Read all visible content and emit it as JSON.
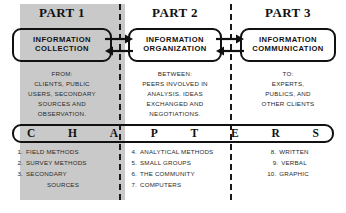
{
  "diagram": {
    "banner_word": "CHAPTERS",
    "banner_letters": [
      "C",
      "H",
      "A",
      "P",
      "T",
      "E",
      "R",
      "S"
    ],
    "colors": {
      "ink": "#111111",
      "shade": "#c9c9c9",
      "body_text": "#2a2a2a",
      "page": "#ffffff"
    },
    "connectors": [
      {
        "name": "collection-organization-arrows",
        "direction": "bidirectional"
      },
      {
        "name": "organization-communication-arrows",
        "direction": "bidirectional"
      }
    ],
    "parts": [
      {
        "heading": "PART 1",
        "box": {
          "line1": "INFORMATION",
          "line2": "COLLECTION"
        },
        "description": [
          "FROM:",
          "CLIENTS, PUBLIC",
          "USERS, SECONDARY",
          "SOURCES AND",
          "OBSERVATION."
        ],
        "chapters": [
          {
            "num": "1.",
            "title": "FIELD METHODS"
          },
          {
            "num": "2.",
            "title": "SURVEY METHODS"
          },
          {
            "num": "3.",
            "title": "SECONDARY"
          },
          {
            "num": "",
            "title": "SOURCES"
          }
        ]
      },
      {
        "heading": "PART 2",
        "box": {
          "line1": "INFORMATION",
          "line2": "ORGANIZATION"
        },
        "description": [
          "BETWEEN:",
          "PEERS INVOLVED IN",
          "ANALYSIS. IDEAS",
          "EXCHANGED AND",
          "NEGOTIATIONS."
        ],
        "chapters": [
          {
            "num": "4.",
            "title": "ANALYTICAL METHODS"
          },
          {
            "num": "5.",
            "title": "SMALL GROUPS"
          },
          {
            "num": "6.",
            "title": "THE COMMUNITY"
          },
          {
            "num": "7.",
            "title": "COMPUTERS"
          }
        ]
      },
      {
        "heading": "PART 3",
        "box": {
          "line1": "INFORMATION",
          "line2": "COMMUNICATION"
        },
        "description": [
          "TO:",
          "EXPERTS,",
          "PUBLICS, AND",
          "OTHER CLIENTS"
        ],
        "chapters": [
          {
            "num": "8.",
            "title": "WRITTEN"
          },
          {
            "num": "9.",
            "title": "VERBAL"
          },
          {
            "num": "10.",
            "title": "GRAPHIC"
          }
        ]
      }
    ]
  }
}
